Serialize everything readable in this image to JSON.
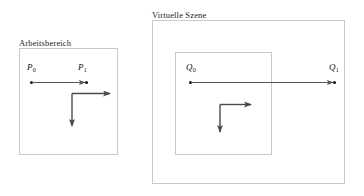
{
  "figure": {
    "type": "diagram",
    "background_color": "#ffffff",
    "box_border_color": "#c9c9c9",
    "vector_color": "#555555",
    "axis_color": "#4a4a4a",
    "point_color": "#111111"
  },
  "workspace": {
    "caption": "Arbeitsbereich",
    "points": {
      "start": {
        "name": "P",
        "subscript": "0"
      },
      "end": {
        "name": "P",
        "subscript": "1"
      }
    },
    "axes": {
      "x_direction": "right",
      "y_direction": "down"
    }
  },
  "scene": {
    "caption": "Virtuelle Szene",
    "points": {
      "start": {
        "name": "Q",
        "subscript": "0"
      },
      "end": {
        "name": "Q",
        "subscript": "1"
      }
    },
    "axes": {
      "x_direction": "right",
      "y_direction": "down"
    }
  }
}
